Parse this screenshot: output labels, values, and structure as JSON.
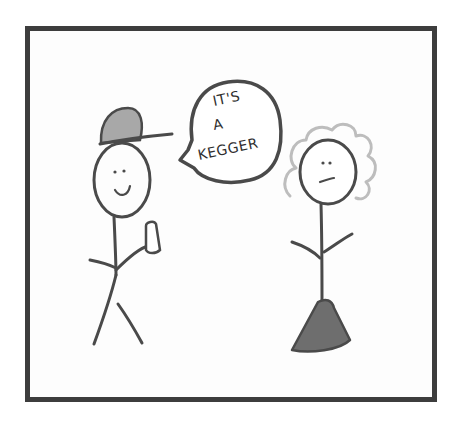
{
  "comic": {
    "speech_bubble": {
      "lines": [
        "IT'S",
        "A",
        "KEGGER"
      ]
    },
    "characters": [
      {
        "name": "guy",
        "accessory": "cap",
        "holding": "cup",
        "expression": "smile"
      },
      {
        "name": "girl",
        "hair": "curly",
        "clothing": "triangle-dress",
        "expression": "neutral"
      }
    ],
    "colors": {
      "frame": "#3d3d3d",
      "ink": "#4a4a4a",
      "cap_fill": "#a8a8a8",
      "dress_fill": "#6e6e6e",
      "hair": "#bdbdbd"
    }
  }
}
